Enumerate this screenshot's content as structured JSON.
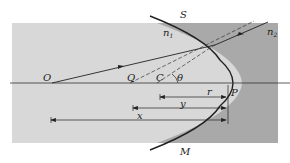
{
  "diagram": {
    "colors": {
      "medium1": "#d8d8d8",
      "medium2": "#a9a9a9",
      "line": "#222222",
      "background": "#ffffff"
    },
    "points": {
      "O": "O",
      "Q": "Q",
      "C": "C",
      "P": "P",
      "S": "S",
      "M": "M"
    },
    "media": {
      "n1": "n",
      "n1_sub": "1",
      "n2": "n",
      "n2_sub": "2"
    },
    "angle": "θ",
    "distances": {
      "r": "r",
      "y": "y",
      "x": "x"
    }
  }
}
